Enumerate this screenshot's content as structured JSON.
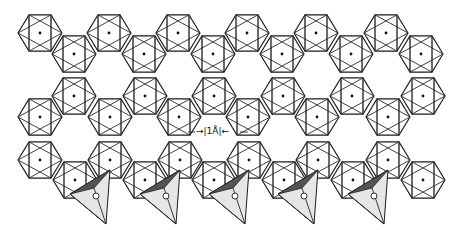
{
  "figure": {
    "scale_bar": {
      "label": "|1Å|",
      "left_arrow": "→",
      "right_arrow": "←",
      "x": 196,
      "y": 132
    },
    "octahedron_rows": [
      {
        "name": "row-a",
        "y": 33,
        "x": [
          40,
          109,
          178,
          247,
          316,
          386
        ]
      },
      {
        "name": "row-b",
        "y": 54,
        "x": [
          74,
          144,
          213,
          282,
          351,
          421
        ]
      },
      {
        "name": "row-c",
        "y": 96,
        "x": [
          74,
          145,
          214,
          283,
          352,
          423
        ]
      },
      {
        "name": "row-d",
        "y": 117,
        "x": [
          40,
          110,
          179,
          248,
          317,
          388
        ]
      },
      {
        "name": "row-e",
        "y": 160,
        "x": [
          40,
          110,
          180,
          249,
          318,
          388
        ]
      },
      {
        "name": "row-f",
        "y": 180,
        "x": [
          75,
          145,
          214,
          284,
          353,
          423
        ]
      }
    ],
    "octahedron_radius": 22,
    "tetrahedra": [
      {
        "cx": 92,
        "cy": 200
      },
      {
        "cx": 162,
        "cy": 200
      },
      {
        "cx": 231,
        "cy": 200
      },
      {
        "cx": 300,
        "cy": 200
      },
      {
        "cx": 370,
        "cy": 200
      }
    ],
    "colors": {
      "line": "#2a2a2a",
      "background": "#ffffff",
      "tetra_fill": "#e6e6e6",
      "tetra_shade": "#555555"
    }
  }
}
